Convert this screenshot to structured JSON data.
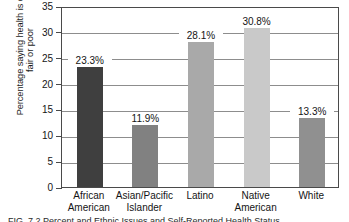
{
  "chart_data": {
    "type": "bar",
    "title": "",
    "xlabel": "",
    "ylabel_lines": [
      "Percentage saying health is only",
      "fair or poor"
    ],
    "ylabel": "Percentage saying health is only fair or poor",
    "categories": [
      "African American",
      "Asian/Pacific Islander",
      "Latino",
      "Native American",
      "White"
    ],
    "category_lines": [
      [
        "African",
        "American"
      ],
      [
        "Asian/Pacific",
        "Islander"
      ],
      [
        "Latino",
        ""
      ],
      [
        "Native",
        "American"
      ],
      [
        "White",
        ""
      ]
    ],
    "values": [
      23.3,
      11.9,
      28.1,
      30.8,
      13.3
    ],
    "value_labels": [
      "23.3%",
      "11.9%",
      "28.1%",
      "30.8%",
      "13.3%"
    ],
    "ylim": [
      0,
      35
    ],
    "yticks": [
      0,
      5,
      10,
      15,
      20,
      25,
      30,
      35
    ],
    "ytick_labels": [
      "0",
      "5",
      "10",
      "15",
      "20",
      "25",
      "30",
      "35"
    ],
    "grid": true,
    "legend": "none",
    "bar_colors": [
      "#3f3f3f",
      "#818181",
      "#a9a9a9",
      "#c9c9c9",
      "#909090"
    ]
  },
  "caption": {
    "text": "FIG. 7.2  Percent and Ethnic Issues and Self-Reported Health Status"
  }
}
